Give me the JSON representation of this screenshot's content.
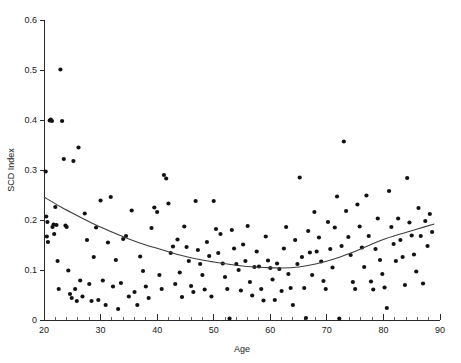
{
  "chart_data": {
    "type": "scatter",
    "title": "",
    "xlabel": "Age",
    "ylabel": "SCD Index",
    "xlim": [
      20,
      90
    ],
    "ylim": [
      0,
      0.6
    ],
    "grid": false,
    "legend": null,
    "xticks": [
      20,
      30,
      40,
      50,
      60,
      70,
      80,
      90
    ],
    "xticklabels": [
      "20",
      "30",
      "40",
      "50",
      "60",
      "70",
      "80",
      "90"
    ],
    "xminor_step": 2,
    "yticks": [
      0,
      0.1,
      0.2,
      0.3,
      0.4,
      0.5,
      0.6
    ],
    "yticklabels": [
      "0",
      "0.1",
      "0.2",
      "0.3",
      "0.4",
      "0.5",
      "0.6"
    ],
    "marker": "filled-circle",
    "marker_color": "#121212",
    "marker_size_px": 2.1,
    "series": [
      {
        "name": "SCD Index by Age",
        "points": [
          [
            20.3,
            0.297
          ],
          [
            20.4,
            0.207
          ],
          [
            20.5,
            0.167
          ],
          [
            20.6,
            0.196
          ],
          [
            20.7,
            0.156
          ],
          [
            21.0,
            0.399
          ],
          [
            21.2,
            0.401
          ],
          [
            21.4,
            0.398
          ],
          [
            21.5,
            0.186
          ],
          [
            21.7,
            0.191
          ],
          [
            21.8,
            0.172
          ],
          [
            22.0,
            0.226
          ],
          [
            22.2,
            0.19
          ],
          [
            22.4,
            0.118
          ],
          [
            22.6,
            0.062
          ],
          [
            22.9,
            0.501
          ],
          [
            23.2,
            0.398
          ],
          [
            23.5,
            0.322
          ],
          [
            23.8,
            0.189
          ],
          [
            24.0,
            0.186
          ],
          [
            24.3,
            0.099
          ],
          [
            24.6,
            0.052
          ],
          [
            24.9,
            0.044
          ],
          [
            25.2,
            0.318
          ],
          [
            25.5,
            0.062
          ],
          [
            25.8,
            0.038
          ],
          [
            26.1,
            0.345
          ],
          [
            26.4,
            0.079
          ],
          [
            26.8,
            0.047
          ],
          [
            27.2,
            0.213
          ],
          [
            27.6,
            0.16
          ],
          [
            28.0,
            0.072
          ],
          [
            28.4,
            0.038
          ],
          [
            28.8,
            0.126
          ],
          [
            29.2,
            0.185
          ],
          [
            29.6,
            0.04
          ],
          [
            30.0,
            0.239
          ],
          [
            30.4,
            0.079
          ],
          [
            30.9,
            0.03
          ],
          [
            31.3,
            0.155
          ],
          [
            31.8,
            0.246
          ],
          [
            32.2,
            0.067
          ],
          [
            32.7,
            0.12
          ],
          [
            33.1,
            0.022
          ],
          [
            33.6,
            0.074
          ],
          [
            34.0,
            0.162
          ],
          [
            34.5,
            0.168
          ],
          [
            35.0,
            0.047
          ],
          [
            35.5,
            0.219
          ],
          [
            36.0,
            0.056
          ],
          [
            36.5,
            0.03
          ],
          [
            37.0,
            0.127
          ],
          [
            37.5,
            0.098
          ],
          [
            38.0,
            0.067
          ],
          [
            38.5,
            0.044
          ],
          [
            39.0,
            0.184
          ],
          [
            39.5,
            0.225
          ],
          [
            40.0,
            0.216
          ],
          [
            40.4,
            0.09
          ],
          [
            40.8,
            0.062
          ],
          [
            41.2,
            0.29
          ],
          [
            41.6,
            0.283
          ],
          [
            42.0,
            0.233
          ],
          [
            42.4,
            0.134
          ],
          [
            42.8,
            0.147
          ],
          [
            43.2,
            0.072
          ],
          [
            43.6,
            0.161
          ],
          [
            44.0,
            0.095
          ],
          [
            44.4,
            0.046
          ],
          [
            44.8,
            0.187
          ],
          [
            45.2,
            0.146
          ],
          [
            45.6,
            0.118
          ],
          [
            46.0,
            0.068
          ],
          [
            46.4,
            0.056
          ],
          [
            46.8,
            0.238
          ],
          [
            47.2,
            0.14
          ],
          [
            47.6,
            0.112
          ],
          [
            48.0,
            0.09
          ],
          [
            48.4,
            0.061
          ],
          [
            48.8,
            0.156
          ],
          [
            49.2,
            0.128
          ],
          [
            49.6,
            0.047
          ],
          [
            50.0,
            0.238
          ],
          [
            50.4,
            0.182
          ],
          [
            50.8,
            0.134
          ],
          [
            51.2,
            0.172
          ],
          [
            51.6,
            0.113
          ],
          [
            52.0,
            0.086
          ],
          [
            52.4,
            0.062
          ],
          [
            52.8,
            0.003
          ],
          [
            53.2,
            0.18
          ],
          [
            53.6,
            0.143
          ],
          [
            54.0,
            0.112
          ],
          [
            54.4,
            0.1
          ],
          [
            54.8,
            0.059
          ],
          [
            55.2,
            0.151
          ],
          [
            55.6,
            0.118
          ],
          [
            56.0,
            0.188
          ],
          [
            56.4,
            0.076
          ],
          [
            56.8,
            0.049
          ],
          [
            57.2,
            0.106
          ],
          [
            57.6,
            0.137
          ],
          [
            58.0,
            0.107
          ],
          [
            58.4,
            0.062
          ],
          [
            58.8,
            0.039
          ],
          [
            59.2,
            0.167
          ],
          [
            59.6,
            0.119
          ],
          [
            60.0,
            0.104
          ],
          [
            60.4,
            0.081
          ],
          [
            60.8,
            0.04
          ],
          [
            61.2,
            0.113
          ],
          [
            61.6,
            0.102
          ],
          [
            62.0,
            0.058
          ],
          [
            62.4,
            0.143
          ],
          [
            62.8,
            0.186
          ],
          [
            63.2,
            0.092
          ],
          [
            63.6,
            0.064
          ],
          [
            64.0,
            0.03
          ],
          [
            64.4,
            0.16
          ],
          [
            64.8,
            0.112
          ],
          [
            65.2,
            0.285
          ],
          [
            65.6,
            0.126
          ],
          [
            66.0,
            0.064
          ],
          [
            66.3,
            0.004
          ],
          [
            66.7,
            0.178
          ],
          [
            67.0,
            0.135
          ],
          [
            67.4,
            0.09
          ],
          [
            67.8,
            0.216
          ],
          [
            68.2,
            0.137
          ],
          [
            68.6,
            0.165
          ],
          [
            69.0,
            0.117
          ],
          [
            69.4,
            0.078
          ],
          [
            69.8,
            0.062
          ],
          [
            70.2,
            0.196
          ],
          [
            70.6,
            0.142
          ],
          [
            71.0,
            0.105
          ],
          [
            71.4,
            0.185
          ],
          [
            71.8,
            0.247
          ],
          [
            72.2,
            0.003
          ],
          [
            72.6,
            0.148
          ],
          [
            73.0,
            0.357
          ],
          [
            73.4,
            0.218
          ],
          [
            73.8,
            0.166
          ],
          [
            74.2,
            0.13
          ],
          [
            74.6,
            0.076
          ],
          [
            75.0,
            0.062
          ],
          [
            75.4,
            0.231
          ],
          [
            75.8,
            0.187
          ],
          [
            76.2,
            0.145
          ],
          [
            76.6,
            0.106
          ],
          [
            77.0,
            0.249
          ],
          [
            77.4,
            0.168
          ],
          [
            77.8,
            0.077
          ],
          [
            78.2,
            0.061
          ],
          [
            78.6,
            0.142
          ],
          [
            79.0,
            0.203
          ],
          [
            79.4,
            0.12
          ],
          [
            79.8,
            0.092
          ],
          [
            80.2,
            0.065
          ],
          [
            80.6,
            0.024
          ],
          [
            81.0,
            0.258
          ],
          [
            81.4,
            0.186
          ],
          [
            81.8,
            0.152
          ],
          [
            82.2,
            0.118
          ],
          [
            82.6,
            0.203
          ],
          [
            83.0,
            0.16
          ],
          [
            83.4,
            0.126
          ],
          [
            83.8,
            0.07
          ],
          [
            84.2,
            0.284
          ],
          [
            84.6,
            0.195
          ],
          [
            85.0,
            0.169
          ],
          [
            85.4,
            0.131
          ],
          [
            85.8,
            0.097
          ],
          [
            86.2,
            0.224
          ],
          [
            86.6,
            0.168
          ],
          [
            87.0,
            0.073
          ],
          [
            87.4,
            0.198
          ],
          [
            87.8,
            0.148
          ],
          [
            88.2,
            0.212
          ],
          [
            88.6,
            0.176
          ]
        ]
      }
    ],
    "fit_curve": {
      "name": "quadratic-fit",
      "type": "quadratic",
      "color": "#3d3d3d",
      "x_range": [
        20,
        89
      ],
      "vertex": [
        60.5,
        0.104
      ],
      "endpoints": [
        [
          20,
          0.246
        ],
        [
          89,
          0.192
        ]
      ],
      "points": [
        [
          20,
          0.246
        ],
        [
          23,
          0.226
        ],
        [
          26,
          0.208
        ],
        [
          29,
          0.191
        ],
        [
          32,
          0.176
        ],
        [
          35,
          0.162
        ],
        [
          38,
          0.15
        ],
        [
          41,
          0.14
        ],
        [
          44,
          0.13
        ],
        [
          47,
          0.122
        ],
        [
          50,
          0.116
        ],
        [
          53,
          0.111
        ],
        [
          56,
          0.107
        ],
        [
          59,
          0.105
        ],
        [
          62,
          0.104
        ],
        [
          65,
          0.106
        ],
        [
          68,
          0.112
        ],
        [
          71,
          0.121
        ],
        [
          74,
          0.133
        ],
        [
          77,
          0.147
        ],
        [
          80,
          0.161
        ],
        [
          83,
          0.172
        ],
        [
          86,
          0.182
        ],
        [
          89,
          0.192
        ]
      ]
    }
  },
  "geometry": {
    "plot_left_px": 44,
    "plot_right_px": 440,
    "plot_top_px": 20,
    "plot_bottom_px": 320
  }
}
